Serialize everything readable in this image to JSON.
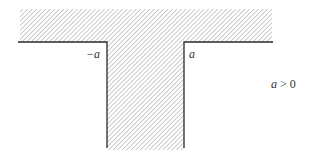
{
  "diagram": {
    "type": "hatched-region",
    "labels": {
      "left_corner": "−a",
      "right_corner": "a",
      "condition_var": "a",
      "condition_rest": " > 0"
    },
    "colors": {
      "hatch": "#9a9a9a",
      "boundary": "#2a2a2a",
      "background": "#ffffff"
    }
  }
}
